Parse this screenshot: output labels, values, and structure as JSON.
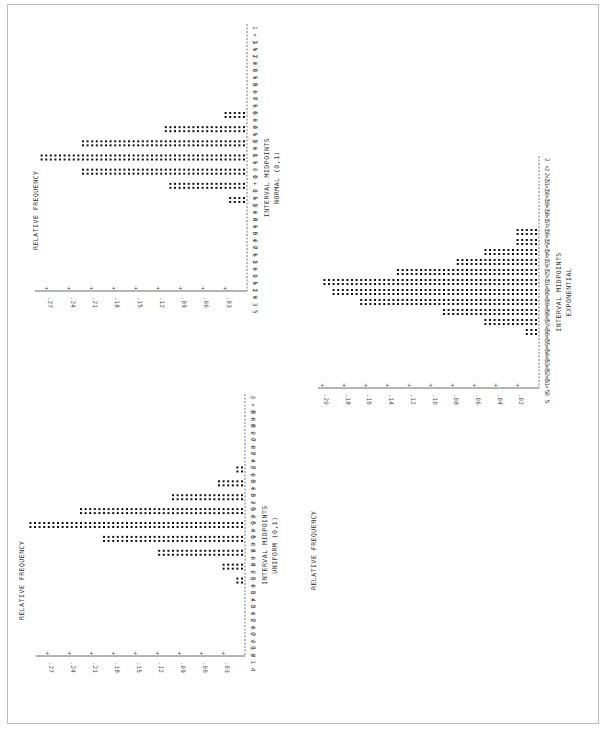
{
  "chart_data": [
    {
      "type": "bar",
      "orientation": "rotated-90",
      "title": "NORMAL (0,1)",
      "xlabel": "INTERVAL MIDPOINTS",
      "ylabel": "RELATIVE FREQUENCY",
      "categories": [
        "1.35",
        "1.20",
        "1.05",
        "0.90",
        "0.75",
        "0.60",
        "0.45",
        "0.30",
        "0.15",
        "0.00",
        "-0.15",
        "-0.30",
        "-0.45",
        "-0.60",
        "-0.75",
        "-0.90",
        "-1.05",
        "-1.20",
        "-1.35"
      ],
      "values": [
        0,
        0,
        0,
        0,
        0,
        0,
        0.03,
        0.11,
        0.225,
        0.276,
        0.225,
        0.106,
        0.026,
        0,
        0,
        0,
        0,
        0,
        0
      ],
      "yticks": [
        ".03",
        ".06",
        ".09",
        ".12",
        ".15",
        ".18",
        ".21",
        ".24",
        ".27"
      ],
      "ylim": [
        0,
        0.28
      ]
    },
    {
      "type": "bar",
      "orientation": "rotated-90",
      "title": "UNIFORM (0,1)",
      "xlabel": "INTERVAL MIDPOINTS",
      "ylabel": "RELATIVE FREQUENCY",
      "categories": [
        "0.86",
        "0.82",
        "0.78",
        "0.74",
        "0.70",
        "0.66",
        "0.62",
        "0.58",
        "0.54",
        "0.50",
        "0.46",
        "0.42",
        "0.38",
        "0.34",
        "0.30",
        "0.26",
        "0.22",
        "0.18",
        "0.14"
      ],
      "values": [
        0,
        0,
        0,
        0,
        0,
        0.01,
        0.038,
        0.098,
        0.225,
        0.293,
        0.195,
        0.12,
        0.031,
        0.01,
        0,
        0,
        0,
        0,
        0
      ],
      "yticks": [
        ".03",
        ".06",
        ".09",
        ".12",
        ".15",
        ".18",
        ".21",
        ".24",
        ".27"
      ],
      "ylim": [
        0,
        0.28
      ]
    },
    {
      "type": "bar",
      "orientation": "rotated-90",
      "title": "EXPONENTIAL",
      "xlabel": "INTERVAL MIDPOINTS",
      "ylabel": "RELATIVE FREQUENCY",
      "categories": [
        "2.25",
        "2.15",
        "2.05",
        "1.95",
        "1.85",
        "1.75",
        "1.65",
        "1.55",
        "1.45",
        "1.35",
        "1.25",
        "1.15",
        "1.05",
        "0.95",
        "0.85",
        "0.75",
        "0.65",
        "0.55",
        "0.45",
        "0.35",
        "0.25",
        "0.15",
        "0.05"
      ],
      "values": [
        0,
        0,
        0,
        0,
        0,
        0,
        0,
        0.02,
        0.02,
        0.05,
        0.075,
        0.13,
        0.2,
        0.19,
        0.167,
        0.09,
        0.05,
        0.012,
        0,
        0,
        0,
        0,
        0
      ],
      "yticks": [
        ".02",
        ".04",
        ".06",
        ".08",
        ".10",
        ".12",
        ".14",
        ".16",
        ".18",
        ".20"
      ],
      "ylim": [
        0,
        0.2
      ]
    }
  ],
  "panels": {
    "normal": {
      "ylabel": "RELATIVE FREQUENCY",
      "xlabel": "INTERVAL MIDPOINTS",
      "title": "NORMAL (0,1)"
    },
    "uniform": {
      "ylabel": "RELATIVE FREQUENCY",
      "xlabel": "INTERVAL MIDPOINTS",
      "title": "UNIFORM (0,1)"
    },
    "exponential": {
      "ylabel": "RELATIVE FREQUENCY",
      "xlabel": "INTERVAL MIDPOINTS",
      "title": "EXPONENTIAL"
    }
  }
}
